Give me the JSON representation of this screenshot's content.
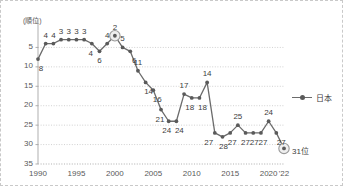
{
  "chart_data": {
    "type": "line",
    "title": "",
    "xlabel": "",
    "ylabel": "(順位)",
    "x": [
      1990,
      1991,
      1992,
      1993,
      1994,
      1995,
      1996,
      1997,
      1998,
      1999,
      2000,
      2001,
      2002,
      2003,
      2004,
      2005,
      2006,
      2007,
      2008,
      2009,
      2010,
      2011,
      2012,
      2013,
      2014,
      2015,
      2016,
      2017,
      2018,
      2019,
      2020,
      2021,
      2022
    ],
    "values": [
      8,
      4,
      4,
      3,
      3,
      3,
      3,
      4,
      6,
      4,
      2,
      5,
      6,
      11,
      14,
      16,
      21,
      24,
      24,
      17,
      18,
      18,
      14,
      27,
      28,
      27,
      25,
      27,
      27,
      27,
      24,
      27,
      31
    ],
    "series": [
      {
        "name": "日本",
        "values": [
          8,
          4,
          4,
          3,
          3,
          3,
          3,
          4,
          6,
          4,
          2,
          5,
          6,
          11,
          14,
          16,
          21,
          24,
          24,
          17,
          18,
          18,
          14,
          27,
          28,
          27,
          25,
          27,
          27,
          27,
          24,
          27,
          31
        ]
      }
    ],
    "point_labels": [
      "8",
      "4",
      "4",
      "3",
      "3",
      "3",
      "3",
      "4",
      "6",
      "4",
      "2",
      "5",
      "6",
      "11",
      "14",
      "16",
      "21",
      "24",
      "24",
      "17",
      "18",
      "18",
      "14",
      "27",
      "28",
      "27",
      "25",
      "27",
      "27",
      "27",
      "24",
      "27",
      ""
    ],
    "xticks": [
      "1990",
      "1995",
      "2000",
      "2005",
      "2010",
      "2015",
      "2020",
      "'22"
    ],
    "xtick_values": [
      1990,
      1995,
      2000,
      2005,
      2010,
      2015,
      2020,
      2022
    ],
    "yticks": [
      "5",
      "10",
      "15",
      "20",
      "25",
      "30",
      "35"
    ],
    "ytick_values": [
      5,
      10,
      15,
      20,
      25,
      30,
      35
    ],
    "ylim": [
      0,
      35
    ],
    "xlim": [
      1990,
      2022
    ],
    "y_axis_inverted": true,
    "grid": "horizontal-dotted",
    "legend_position": "right",
    "highlights": [
      {
        "year": 2000,
        "value": 2,
        "style": "ring"
      },
      {
        "year": 2022,
        "value": 31,
        "style": "ring"
      }
    ],
    "annotations": [
      {
        "text": "31位",
        "year": 2022,
        "value": 31
      }
    ],
    "colors": {
      "line": "#6b6b6b",
      "marker": "#5a5a5a",
      "grid": "#bdbdbd",
      "axis": "#a6a6a6",
      "text": "#404040",
      "border": "#c9c9c9",
      "highlight_ring": "#9a9a9a",
      "background": "#ffffff"
    }
  },
  "legend": {
    "entries": [
      {
        "label": "日本",
        "marker": "line-with-dot"
      }
    ]
  },
  "axis_titles": {
    "y": "(順位)"
  },
  "end_annotation": {
    "text": "31位"
  }
}
